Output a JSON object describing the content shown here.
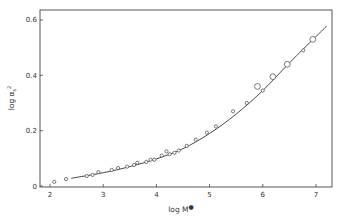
{
  "chart_data": {
    "type": "scatter",
    "title": "",
    "xlabel": "log M*",
    "ylabel": "log αs²",
    "xlim": [
      1.85,
      7.3
    ],
    "ylim": [
      0,
      0.65
    ],
    "xticks": [
      2,
      3,
      4,
      5,
      6,
      7
    ],
    "yticks": [
      0,
      0.2,
      0.4,
      0.6
    ],
    "xtick_labels": [
      "2",
      "3",
      "4",
      "5",
      "6",
      "7"
    ],
    "ytick_labels": [
      "0",
      "0.2",
      "0.4",
      "0.6"
    ],
    "grid": false,
    "legend": null,
    "series": [
      {
        "name": "small circles",
        "marker": "small-open-circle",
        "points": [
          [
            2.08,
            0.015
          ],
          [
            2.3,
            0.025
          ],
          [
            2.69,
            0.036
          ],
          [
            2.8,
            0.04
          ],
          [
            2.91,
            0.05
          ],
          [
            3.16,
            0.058
          ],
          [
            3.28,
            0.065
          ],
          [
            3.45,
            0.07
          ],
          [
            3.58,
            0.076
          ],
          [
            3.64,
            0.084
          ],
          [
            3.81,
            0.087
          ],
          [
            3.89,
            0.095
          ],
          [
            3.96,
            0.095
          ],
          [
            4.1,
            0.11
          ],
          [
            4.19,
            0.125
          ],
          [
            4.25,
            0.115
          ],
          [
            4.34,
            0.12
          ],
          [
            4.42,
            0.128
          ],
          [
            4.57,
            0.145
          ],
          [
            4.74,
            0.167
          ],
          [
            4.95,
            0.193
          ],
          [
            5.12,
            0.215
          ],
          [
            5.44,
            0.27
          ],
          [
            5.7,
            0.3
          ],
          [
            6.0,
            0.345
          ],
          [
            6.76,
            0.49
          ]
        ]
      },
      {
        "name": "large circles",
        "marker": "large-open-circle",
        "points": [
          [
            5.9,
            0.36
          ],
          [
            6.19,
            0.395
          ],
          [
            6.46,
            0.44
          ],
          [
            6.94,
            0.53
          ]
        ]
      },
      {
        "name": "fitted curve",
        "marker": "line",
        "points": [
          [
            2.4,
            0.028
          ],
          [
            3.0,
            0.048
          ],
          [
            3.5,
            0.07
          ],
          [
            4.0,
            0.098
          ],
          [
            4.5,
            0.135
          ],
          [
            5.0,
            0.19
          ],
          [
            5.5,
            0.26
          ],
          [
            6.0,
            0.345
          ],
          [
            6.5,
            0.445
          ],
          [
            7.0,
            0.54
          ],
          [
            7.2,
            0.578
          ]
        ]
      }
    ]
  }
}
